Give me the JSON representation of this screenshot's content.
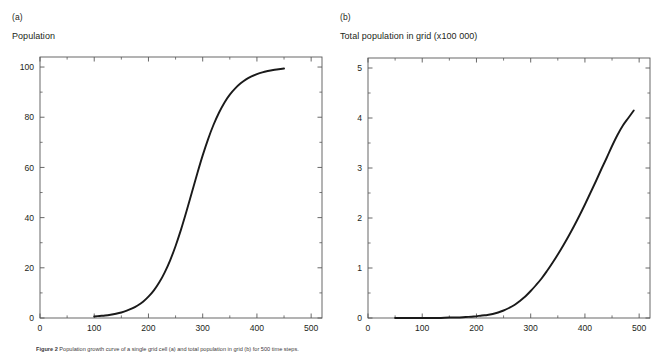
{
  "figure": {
    "caption_label": "Figure 2",
    "caption_text": "Population growth curve of a single grid cell (a) and total population in grid (b) for 500 time steps.",
    "background_color": "#ffffff",
    "line_color": "#1a1a1a",
    "axis_color": "#585858"
  },
  "panels": [
    {
      "letter": "(a)",
      "axis_title": "Population",
      "chart_ref": 0
    },
    {
      "letter": "(b)",
      "axis_title": "Total population in grid  (x100 000)",
      "chart_ref": 1
    }
  ],
  "chart_data": [
    {
      "type": "line",
      "title": "Population",
      "panel": "(a)",
      "xlabel": "",
      "ylabel": "Population",
      "xlim": [
        0,
        520
      ],
      "ylim": [
        0,
        104
      ],
      "xticks": [
        0,
        100,
        200,
        300,
        400,
        500
      ],
      "yticks": [
        0,
        20,
        40,
        60,
        80,
        100
      ],
      "xticklabels": [
        "0",
        "100",
        "200",
        "300",
        "400",
        "500"
      ],
      "yticklabels": [
        "0",
        "20",
        "40",
        "60",
        "80",
        "100"
      ],
      "grid": false,
      "legend": false,
      "series": [
        {
          "name": "Population",
          "x": [
            100,
            110,
            120,
            130,
            140,
            150,
            160,
            170,
            180,
            190,
            200,
            210,
            220,
            230,
            240,
            250,
            260,
            270,
            280,
            290,
            300,
            310,
            320,
            330,
            340,
            350,
            360,
            370,
            380,
            390,
            400,
            410,
            420,
            430,
            440,
            450
          ],
          "y": [
            0.6,
            0.8,
            1.0,
            1.3,
            1.7,
            2.2,
            2.9,
            3.8,
            5.0,
            6.5,
            8.5,
            11.0,
            14.2,
            18.2,
            23.0,
            28.7,
            35.2,
            42.4,
            50.0,
            57.6,
            64.8,
            71.3,
            77.0,
            81.8,
            85.8,
            89.0,
            91.5,
            93.5,
            95.1,
            96.3,
            97.2,
            97.9,
            98.4,
            98.8,
            99.1,
            99.4
          ]
        }
      ]
    },
    {
      "type": "line",
      "title": "Total population in grid  (x100 000)",
      "panel": "(b)",
      "xlabel": "",
      "ylabel": "Total population in grid (x100 000)",
      "xlim": [
        0,
        520
      ],
      "ylim": [
        0,
        5.2
      ],
      "xticks": [
        0,
        100,
        200,
        300,
        400,
        500
      ],
      "yticks": [
        0,
        1,
        2,
        3,
        4,
        5
      ],
      "xticklabels": [
        "0",
        "100",
        "200",
        "300",
        "400",
        "500"
      ],
      "yticklabels": [
        "0",
        "1",
        "2",
        "3",
        "4",
        "5"
      ],
      "grid": false,
      "legend": false,
      "series": [
        {
          "name": "Total population in grid",
          "x": [
            50,
            70,
            90,
            110,
            130,
            150,
            165,
            180,
            195,
            210,
            220,
            230,
            240,
            250,
            260,
            270,
            280,
            290,
            300,
            310,
            320,
            330,
            340,
            350,
            360,
            370,
            380,
            390,
            400,
            410,
            420,
            430,
            440,
            450,
            460,
            470,
            480,
            490
          ],
          "y": [
            0.0,
            0.0,
            0.0,
            0.0,
            0.0,
            0.01,
            0.01,
            0.02,
            0.03,
            0.05,
            0.06,
            0.08,
            0.11,
            0.15,
            0.2,
            0.26,
            0.34,
            0.43,
            0.54,
            0.66,
            0.79,
            0.94,
            1.1,
            1.27,
            1.45,
            1.64,
            1.84,
            2.05,
            2.27,
            2.5,
            2.73,
            2.97,
            3.2,
            3.44,
            3.66,
            3.85,
            4.0,
            4.15
          ]
        }
      ]
    }
  ]
}
